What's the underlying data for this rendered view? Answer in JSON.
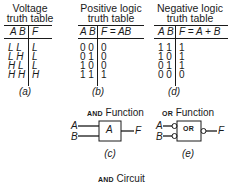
{
  "tables": [
    {
      "id": "a",
      "title_line1": "Voltage",
      "title_line2": "truth table",
      "header_inputs": "A B",
      "header_output": "F",
      "rows": [
        {
          "inputs": "L L",
          "output": "L"
        },
        {
          "inputs": "L H",
          "output": "L"
        },
        {
          "inputs": "H L",
          "output": "L"
        },
        {
          "inputs": "H H",
          "output": "H"
        }
      ],
      "caption": "(a)"
    },
    {
      "id": "b",
      "title_line1": "Positive logic",
      "title_line2": "truth table",
      "header_inputs": "A B",
      "header_output": "F = AB",
      "rows": [
        {
          "inputs": "0 0",
          "output": "0"
        },
        {
          "inputs": "0 1",
          "output": "0"
        },
        {
          "inputs": "1 0",
          "output": "0"
        },
        {
          "inputs": "1 1",
          "output": "1"
        }
      ],
      "caption": "(b)"
    },
    {
      "id": "d",
      "title_line1": "Negative logic",
      "title_line2": "truth table",
      "header_inputs": "A B",
      "header_output": "F = A + B",
      "rows": [
        {
          "inputs": "1 1",
          "output": "1"
        },
        {
          "inputs": "1 0",
          "output": "1"
        },
        {
          "inputs": "0 1",
          "output": "1"
        },
        {
          "inputs": "0 0",
          "output": "0"
        }
      ],
      "caption": "(d)"
    }
  ],
  "gates": {
    "and": {
      "title_smallcaps": "AND",
      "title_rest": "Function",
      "gate_label": "A",
      "input_a": "A",
      "input_b": "B",
      "output": "F",
      "caption": "(c)"
    },
    "or": {
      "title_smallcaps": "OR",
      "title_rest": "Function",
      "gate_label": "OR",
      "input_a": "A",
      "input_b": "B",
      "output": "F",
      "caption": "(e)"
    }
  },
  "footer": {
    "title_smallcaps": "AND",
    "title_rest": "Circuit"
  }
}
